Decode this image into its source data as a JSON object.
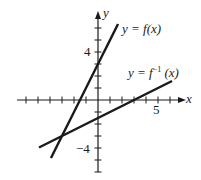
{
  "chart_data": {
    "type": "line",
    "title": "",
    "xlabel": "x",
    "ylabel": "y",
    "xlim": [
      -6.75,
      7
    ],
    "ylim": [
      -6,
      7.33
    ],
    "x_ticks": [
      -6,
      -5,
      -4,
      -3,
      -2,
      -1,
      1,
      2,
      3,
      4,
      5,
      6
    ],
    "y_ticks": [
      -6,
      -5,
      -4,
      -3,
      -2,
      -1,
      1,
      2,
      3,
      4,
      5,
      6
    ],
    "x_tick_labels": [
      {
        "value": 5,
        "label": "5"
      }
    ],
    "y_tick_labels": [
      {
        "value": 4,
        "label": "4"
      },
      {
        "value": -4,
        "label": "−4"
      }
    ],
    "grid": false,
    "series": [
      {
        "name": "y = f(x)",
        "equation": "y = 2x + 3",
        "x": [
          -3.92,
          1.67
        ],
        "y": [
          -4.83,
          6.33
        ]
      },
      {
        "name": "y = f⁻¹(x)",
        "equation": "y = (x − 3)/2",
        "x": [
          -4.92,
          6.17
        ],
        "y": [
          -3.96,
          1.58
        ]
      }
    ],
    "annotations": [
      {
        "text": "y = f(x)",
        "near_series": 0
      },
      {
        "text": "y = f⁻¹ (x)",
        "near_series": 1
      }
    ]
  },
  "labels": {
    "x_axis": "x",
    "y_axis": "y",
    "tick_5": "5",
    "tick_4": "4",
    "tick_neg4": "−4",
    "f_label_prefix": "y = ",
    "f_label_func": "f(x)",
    "finv_label_prefix": "y = ",
    "finv_label_func": "f",
    "finv_label_sup": "−1",
    "finv_label_arg": " (x)"
  },
  "style": {
    "ink": "#1a1a1a",
    "background": "#ffffff"
  }
}
